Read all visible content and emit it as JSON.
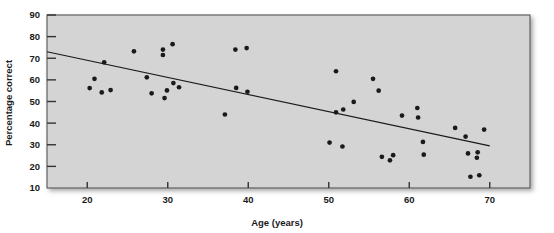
{
  "chart_data": {
    "type": "scatter",
    "title": "",
    "xlabel": "Age (years)",
    "ylabel": "Percentage correct",
    "xlim": [
      15,
      75
    ],
    "ylim": [
      10,
      90
    ],
    "xticks": [
      20,
      30,
      40,
      50,
      60,
      70
    ],
    "yticks": [
      10,
      20,
      30,
      40,
      50,
      60,
      70,
      80,
      90
    ],
    "grid": false,
    "legend": null,
    "plot_background": "#d4d4d4",
    "point_color": "#1a1a1a",
    "line_color": "#1a1a1a",
    "points": [
      {
        "x": 20.3,
        "y": 56.2
      },
      {
        "x": 20.9,
        "y": 60.5
      },
      {
        "x": 21.8,
        "y": 54.2
      },
      {
        "x": 22.1,
        "y": 68.1
      },
      {
        "x": 22.9,
        "y": 55.3
      },
      {
        "x": 25.8,
        "y": 73.2
      },
      {
        "x": 27.4,
        "y": 61.2
      },
      {
        "x": 28.0,
        "y": 53.8
      },
      {
        "x": 29.4,
        "y": 74.0
      },
      {
        "x": 29.4,
        "y": 71.5
      },
      {
        "x": 29.6,
        "y": 51.6
      },
      {
        "x": 29.9,
        "y": 55.1
      },
      {
        "x": 30.6,
        "y": 76.5
      },
      {
        "x": 30.7,
        "y": 58.5
      },
      {
        "x": 31.4,
        "y": 56.6
      },
      {
        "x": 37.1,
        "y": 44.0
      },
      {
        "x": 38.4,
        "y": 74.0
      },
      {
        "x": 38.5,
        "y": 56.3
      },
      {
        "x": 39.8,
        "y": 74.7
      },
      {
        "x": 39.9,
        "y": 54.5
      },
      {
        "x": 50.1,
        "y": 31.0
      },
      {
        "x": 50.9,
        "y": 45.0
      },
      {
        "x": 50.9,
        "y": 64.0
      },
      {
        "x": 51.7,
        "y": 29.2
      },
      {
        "x": 51.8,
        "y": 46.3
      },
      {
        "x": 53.1,
        "y": 49.8
      },
      {
        "x": 55.5,
        "y": 60.5
      },
      {
        "x": 56.2,
        "y": 55.0
      },
      {
        "x": 56.6,
        "y": 24.4
      },
      {
        "x": 57.6,
        "y": 22.8
      },
      {
        "x": 58.0,
        "y": 25.2
      },
      {
        "x": 59.1,
        "y": 43.5
      },
      {
        "x": 61.0,
        "y": 47.0
      },
      {
        "x": 61.1,
        "y": 42.6
      },
      {
        "x": 61.7,
        "y": 31.3
      },
      {
        "x": 61.8,
        "y": 25.4
      },
      {
        "x": 65.7,
        "y": 37.8
      },
      {
        "x": 67.0,
        "y": 33.8
      },
      {
        "x": 67.3,
        "y": 26.0
      },
      {
        "x": 67.6,
        "y": 15.2
      },
      {
        "x": 68.4,
        "y": 24.0
      },
      {
        "x": 68.5,
        "y": 26.5
      },
      {
        "x": 68.7,
        "y": 15.9
      },
      {
        "x": 69.3,
        "y": 37.0
      }
    ],
    "trendline": {
      "x0": 15.0,
      "y0": 73.0,
      "x1": 70.0,
      "y1": 29.5
    }
  }
}
